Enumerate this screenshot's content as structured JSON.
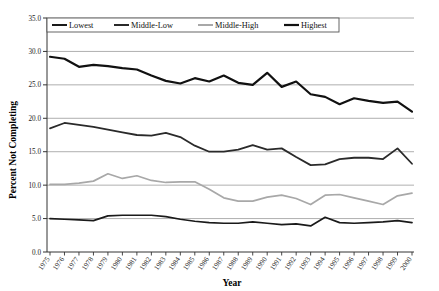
{
  "chart_data": {
    "type": "line",
    "title": "",
    "xlabel": "Year",
    "ylabel": "Percent Not Completing",
    "ylim": [
      0.0,
      35.0
    ],
    "ytick_step": 5.0,
    "yticks": [
      "0.0",
      "5.0",
      "10.0",
      "15.0",
      "20.0",
      "25.0",
      "30.0",
      "35.0"
    ],
    "grid": "horizontal",
    "legend_position": "top-left-inside",
    "categories": [
      "1975",
      "1976",
      "1977",
      "1978",
      "1979",
      "1980",
      "1981",
      "1982",
      "1983",
      "1984",
      "1985",
      "1986",
      "1987",
      "1988",
      "1989",
      "1990",
      "1991",
      "1992",
      "1993",
      "1994",
      "1995",
      "1996",
      "1997",
      "1998",
      "1999",
      "2000"
    ],
    "series": [
      {
        "name": "Lowest",
        "color": "#1a1a1a",
        "width": 1.7,
        "values": [
          5.0,
          4.9,
          4.8,
          4.7,
          5.4,
          5.5,
          5.5,
          5.5,
          5.3,
          4.9,
          4.6,
          4.4,
          4.3,
          4.3,
          4.5,
          4.3,
          4.1,
          4.2,
          3.9,
          5.2,
          4.4,
          4.3,
          4.4,
          4.5,
          4.7,
          4.4
        ]
      },
      {
        "name": "Middle-Low",
        "color": "#2a2a2a",
        "width": 1.8,
        "values": [
          18.5,
          19.3,
          19.0,
          18.7,
          18.3,
          17.9,
          17.5,
          17.4,
          17.8,
          17.2,
          15.9,
          15.0,
          15.0,
          15.3,
          16.0,
          15.3,
          15.5,
          14.2,
          13.0,
          13.1,
          13.9,
          14.1,
          14.1,
          13.9,
          15.5,
          13.2
        ]
      },
      {
        "name": "Middle-High",
        "color": "#a8a8a8",
        "width": 1.7,
        "values": [
          10.1,
          10.1,
          10.3,
          10.6,
          11.7,
          11.0,
          11.4,
          10.7,
          10.4,
          10.5,
          10.5,
          9.4,
          8.1,
          7.6,
          7.6,
          8.2,
          8.5,
          8.0,
          7.1,
          8.5,
          8.6,
          8.1,
          7.6,
          7.1,
          8.4,
          8.8
        ]
      },
      {
        "name": "Highest",
        "color": "#111111",
        "width": 2.2,
        "values": [
          29.2,
          28.9,
          27.7,
          28.0,
          27.8,
          27.5,
          27.3,
          26.4,
          25.6,
          25.2,
          26.0,
          25.5,
          26.4,
          25.3,
          25.0,
          26.8,
          24.7,
          25.5,
          23.6,
          23.2,
          22.1,
          23.0,
          22.6,
          22.3,
          22.5,
          21.0
        ]
      }
    ]
  },
  "legend": {
    "entries": [
      "Lowest",
      "Middle-Low",
      "Middle-High",
      "Highest"
    ]
  },
  "top_fragment": {
    "text": ""
  }
}
